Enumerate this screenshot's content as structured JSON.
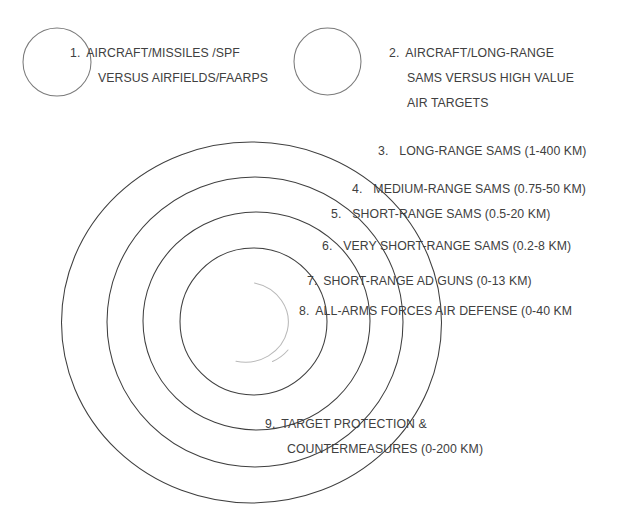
{
  "diagram": {
    "background_color": "#ffffff",
    "text_color": "#404040",
    "ring_stroke_color": "#3f3f3f",
    "inner_circle_stroke_color": "#b9b9b9",
    "callout_circle_stroke_color": "#7a7a7a"
  },
  "callouts": [
    {
      "number": "1.",
      "lines": [
        "AIRCRAFT/MISSILES /SPF",
        "VERSUS AIRFIELDS/FAARPS"
      ],
      "circle_name": "callout-circle-1"
    },
    {
      "number": "2.",
      "lines": [
        "AIRCRAFT/LONG-RANGE",
        "SAMS VERSUS HIGH VALUE",
        "AIR TARGETS"
      ],
      "circle_name": "callout-circle-2"
    }
  ],
  "rings": [
    {
      "number": "3.",
      "label": "LONG-RANGE SAMS (1-400 KM)",
      "range_label": "1-400 KM",
      "range_min_km": 1,
      "range_max_km": 400
    },
    {
      "number": "4.",
      "label": "MEDIUM-RANGE SAMS (0.75-50 KM)",
      "range_label": "0.75-50 KM",
      "range_min_km": 0.75,
      "range_max_km": 50
    },
    {
      "number": "5.",
      "label": "SHORT-RANGE SAMS (0.5-20 KM)",
      "range_label": "0.5-20 KM",
      "range_min_km": 0.5,
      "range_max_km": 20
    },
    {
      "number": "6.",
      "label": "VERY SHORT-RANGE SAMS (0.2-8 KM)",
      "range_label": "0.2-8 KM",
      "range_min_km": 0.2,
      "range_max_km": 8
    },
    {
      "number": "7.",
      "label": "SHORT-RANGE AD GUNS (0-13 KM)",
      "range_label": "0-13 KM",
      "range_min_km": 0,
      "range_max_km": 13
    },
    {
      "number": "8.",
      "label": "ALL-ARMS FORCES AIR DEFENSE (0-40 KM",
      "range_label": "0-40 KM",
      "range_min_km": 0,
      "range_max_km": 40
    },
    {
      "number": "9.",
      "lines": [
        "TARGET PROTECTION &",
        "COUNTERMEASURES (0-200 KM)"
      ],
      "label": "TARGET PROTECTION & COUNTERMEASURES (0-200 KM)",
      "range_label": "0-200 KM",
      "range_min_km": 0,
      "range_max_km": 200
    }
  ]
}
